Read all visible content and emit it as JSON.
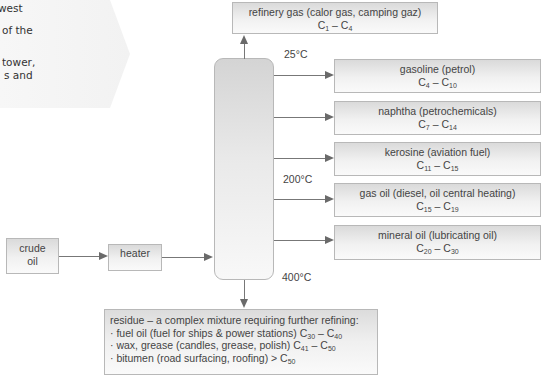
{
  "side_note": {
    "lines": [
      "west",
      "of the",
      "tower,",
      "s and"
    ]
  },
  "diagram": {
    "input": {
      "label_line1": "crude",
      "label_line2": "oil"
    },
    "heater": {
      "label": "heater"
    },
    "temperatures": {
      "top": "25°C",
      "middle": "200°C",
      "bottom": "400°C"
    },
    "fractions": [
      {
        "name": "refinery gas (calor gas, camping gaz)",
        "c_from": "1",
        "c_to": "4"
      },
      {
        "name": "gasoline (petrol)",
        "c_from": "4",
        "c_to": "10"
      },
      {
        "name": "naphtha (petrochemicals)",
        "c_from": "7",
        "c_to": "14"
      },
      {
        "name": "kerosine (aviation fuel)",
        "c_from": "11",
        "c_to": "15"
      },
      {
        "name": "gas oil (diesel, oil central heating)",
        "c_from": "15",
        "c_to": "19"
      },
      {
        "name": "mineral oil (lubricating oil)",
        "c_from": "20",
        "c_to": "30"
      }
    ],
    "residue": {
      "title": "residue – a complex mixture requiring further refining:",
      "items": [
        {
          "text": "· fuel oil (fuel for ships & power stations) C",
          "c_from": "30",
          "dash": " – C",
          "c_to": "40"
        },
        {
          "text": "· wax, grease (candles, grease, polish) C",
          "c_from": "41",
          "dash": " – C",
          "c_to": "50"
        },
        {
          "text": "· bitumen (road surfacing, roofing) > C",
          "c_from": "50"
        }
      ]
    }
  }
}
